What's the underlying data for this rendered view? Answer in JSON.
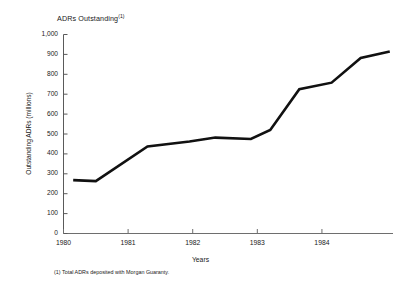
{
  "chart_data": {
    "type": "line",
    "title": "ADRs Outstanding",
    "title_footnote_marker": "(1)",
    "xlabel": "Years",
    "ylabel": "Outstanding ADRs (millions)",
    "xlim": [
      1980.0,
      1985.1
    ],
    "ylim": [
      0,
      1000
    ],
    "grid": false,
    "legend": false,
    "y_ticks": [
      0,
      100,
      200,
      300,
      400,
      500,
      600,
      700,
      800,
      900,
      1000
    ],
    "y_tick_labels": [
      "0",
      "100",
      "200",
      "300",
      "400",
      "500",
      "600",
      "700",
      "800",
      "900",
      "1,000"
    ],
    "x_ticks": [
      1980,
      1981,
      1982,
      1983,
      1984
    ],
    "x_tick_labels": [
      "1980",
      "1981",
      "1982",
      "1983",
      "1984"
    ],
    "series": [
      {
        "name": "ADRs Outstanding",
        "color": "#111111",
        "x": [
          1980.15,
          1980.5,
          1981.3,
          1981.95,
          1982.35,
          1982.9,
          1983.2,
          1983.65,
          1984.15,
          1984.6,
          1985.05
        ],
        "values": [
          268,
          263,
          437,
          462,
          482,
          475,
          520,
          725,
          758,
          882,
          915
        ]
      }
    ],
    "annotations": [
      "(1) Total ADRs deposited with Morgan Guaranty."
    ]
  },
  "labels": {
    "footnote": "(1) Total ADRs deposited with Morgan Guaranty."
  }
}
